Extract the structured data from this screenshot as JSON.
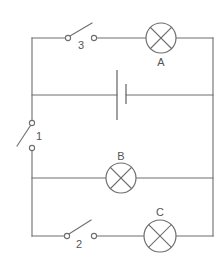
{
  "diagram": {
    "type": "circuit",
    "colors": {
      "line": "#6e6e6e",
      "label": "#555555",
      "background": "#ffffff"
    },
    "components": {
      "switch_1": {
        "label": "1",
        "state": "open"
      },
      "switch_2": {
        "label": "2",
        "state": "open"
      },
      "switch_3": {
        "label": "3",
        "state": "open"
      },
      "lamp_a": {
        "label": "A"
      },
      "lamp_b": {
        "label": "B"
      },
      "lamp_c": {
        "label": "C"
      },
      "battery": {
        "label": ""
      }
    },
    "branches": [
      {
        "name": "top",
        "components": [
          "switch_3",
          "lamp_a"
        ]
      },
      {
        "name": "battery",
        "components": [
          "battery"
        ]
      },
      {
        "name": "middle",
        "components": [
          "lamp_b"
        ]
      },
      {
        "name": "bottom",
        "components": [
          "switch_2",
          "lamp_c"
        ]
      }
    ]
  }
}
